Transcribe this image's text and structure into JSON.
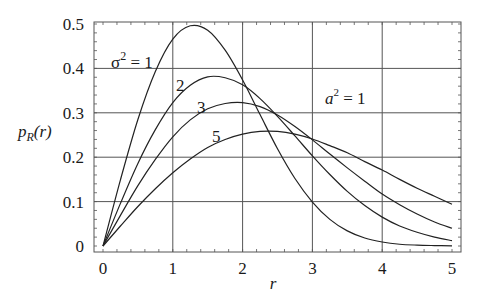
{
  "chart_data": {
    "type": "line",
    "title": "",
    "xlabel": "r",
    "ylabel": "p_R(r)",
    "ylabel_main": "p",
    "ylabel_sub": "R",
    "ylabel_arg": "(r)",
    "xlim": [
      0,
      5
    ],
    "ylim": [
      0,
      0.5
    ],
    "grid": true,
    "x_ticks": [
      "0",
      "1",
      "2",
      "3",
      "4",
      "5"
    ],
    "y_ticks": [
      "0",
      "0.1",
      "0.2",
      "0.3",
      "0.4",
      "0.5"
    ],
    "annotations": [
      {
        "text": "σ² = 1",
        "main": "σ",
        "sup": "2",
        "rest": " = 1",
        "series": "σ²=1"
      },
      {
        "text": "2",
        "series": "σ²=2"
      },
      {
        "text": "3",
        "series": "σ²=3"
      },
      {
        "text": "5",
        "series": "σ²=5"
      },
      {
        "text": "a² = 1",
        "main": "a",
        "sup": "2",
        "rest": " = 1"
      }
    ],
    "x": [
      0,
      0.25,
      0.5,
      0.75,
      1.0,
      1.25,
      1.5,
      1.75,
      2.0,
      2.25,
      2.5,
      2.75,
      3.0,
      3.25,
      3.5,
      3.75,
      4.0,
      4.25,
      4.5,
      4.75,
      5.0
    ],
    "series": [
      {
        "name": "σ²=1",
        "values": [
          0,
          0.149,
          0.285,
          0.393,
          0.466,
          0.496,
          0.486,
          0.441,
          0.374,
          0.296,
          0.219,
          0.152,
          0.099,
          0.06,
          0.034,
          0.018,
          0.009,
          0.004,
          0.002,
          0.001,
          0.0003
        ]
      },
      {
        "name": "σ²=2",
        "values": [
          0,
          0.096,
          0.186,
          0.262,
          0.323,
          0.362,
          0.381,
          0.379,
          0.363,
          0.332,
          0.292,
          0.248,
          0.203,
          0.161,
          0.123,
          0.091,
          0.065,
          0.045,
          0.031,
          0.02,
          0.012
        ]
      },
      {
        "name": "σ²=3",
        "values": [
          0,
          0.069,
          0.136,
          0.195,
          0.246,
          0.284,
          0.309,
          0.321,
          0.323,
          0.314,
          0.295,
          0.269,
          0.239,
          0.207,
          0.176,
          0.146,
          0.117,
          0.093,
          0.072,
          0.054,
          0.04
        ]
      },
      {
        "name": "σ²=5",
        "values": [
          0,
          0.045,
          0.089,
          0.129,
          0.165,
          0.196,
          0.222,
          0.24,
          0.252,
          0.258,
          0.258,
          0.252,
          0.241,
          0.226,
          0.21,
          0.19,
          0.171,
          0.15,
          0.13,
          0.112,
          0.094
        ]
      }
    ],
    "colors": {
      "line": "#222222",
      "grid": "#555555",
      "frame": "#555555",
      "text": "#1a1a1a"
    }
  }
}
